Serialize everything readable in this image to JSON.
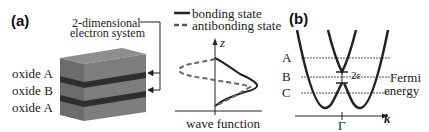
{
  "panel_a": {
    "label": "(a)",
    "title_line1": "2-dimensional",
    "title_line2": "electron system",
    "layers": [
      "oxide A",
      "oxide B",
      "oxide A"
    ],
    "legend": {
      "solid": "bonding state",
      "dashed": "antibonding state"
    },
    "axis_z": "z",
    "axis_x_label": "wave function"
  },
  "panel_b": {
    "label": "(b)",
    "levels": [
      "A",
      "B",
      "C"
    ],
    "gap_label": "2ε",
    "fermi_line1": "Fermi",
    "fermi_line2": "energy",
    "k_label": "k",
    "gamma_label": "Γ"
  },
  "colors": {
    "block_light": "#7a7a7a",
    "block_top": "#8c8c8c",
    "block_dark_layer": "#2e2e2e",
    "line": "#222222",
    "dashed": "#555555"
  }
}
